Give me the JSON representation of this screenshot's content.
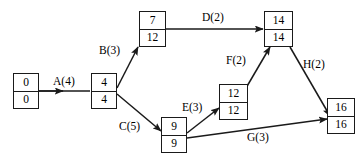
{
  "diagram": {
    "type": "activity-on-arrow-network",
    "colors": {
      "line": "#1a1a1a",
      "text": "#000000",
      "background": "#ffffff"
    },
    "nodes": [
      {
        "id": "n1",
        "earliest": "0",
        "latest": "0",
        "x": 13,
        "y": 73,
        "w": 26,
        "h": 36
      },
      {
        "id": "n2",
        "earliest": "4",
        "latest": "4",
        "x": 91,
        "y": 73,
        "w": 26,
        "h": 36
      },
      {
        "id": "n3",
        "earliest": "7",
        "latest": "12",
        "x": 139,
        "y": 11,
        "w": 27,
        "h": 36
      },
      {
        "id": "n4",
        "earliest": "14",
        "latest": "14",
        "x": 264,
        "y": 11,
        "w": 29,
        "h": 36
      },
      {
        "id": "n5",
        "earliest": "12",
        "latest": "12",
        "x": 219,
        "y": 84,
        "w": 29,
        "h": 36
      },
      {
        "id": "n6",
        "earliest": "9",
        "latest": "9",
        "x": 161,
        "y": 117,
        "w": 26,
        "h": 36
      },
      {
        "id": "n7",
        "earliest": "16",
        "latest": "16",
        "x": 327,
        "y": 98,
        "w": 28,
        "h": 36
      }
    ],
    "edges": [
      {
        "id": "A",
        "label": "A(4)",
        "from": "n1",
        "to": "n2",
        "label_x": 53,
        "label_y": 76
      },
      {
        "id": "B",
        "label": "B(3)",
        "from": "n2",
        "to": "n3",
        "label_x": 99,
        "label_y": 45
      },
      {
        "id": "C",
        "label": "C(5)",
        "from": "n2",
        "to": "n6",
        "label_x": 119,
        "label_y": 121
      },
      {
        "id": "D",
        "label": "D(2)",
        "from": "n3",
        "to": "n4",
        "label_x": 202,
        "label_y": 12
      },
      {
        "id": "E",
        "label": "E(3)",
        "from": "n6",
        "to": "n5",
        "label_x": 182,
        "label_y": 102
      },
      {
        "id": "F",
        "label": "F(2)",
        "from": "n5",
        "to": "n4",
        "label_x": 226,
        "label_y": 55
      },
      {
        "id": "G",
        "label": "G(3)",
        "from": "n6",
        "to": "n7",
        "label_x": 247,
        "label_y": 132
      },
      {
        "id": "H",
        "label": "H(2)",
        "from": "n4",
        "to": "n7",
        "label_x": 303,
        "label_y": 59
      }
    ]
  }
}
